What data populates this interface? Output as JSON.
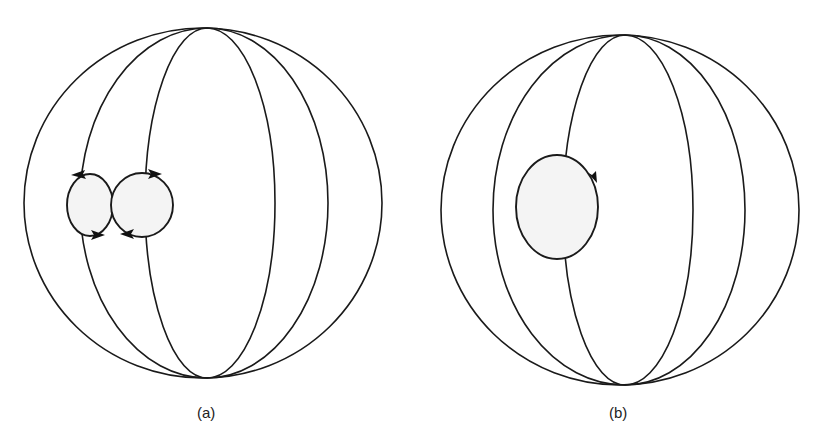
{
  "figure": {
    "panels": [
      {
        "id": "a",
        "caption": "(a)",
        "description": "Sphere with meridians; two adjacent circulation loops of opposite sense on the left side",
        "loops": [
          {
            "name": "left-loop",
            "direction": "counterclockwise"
          },
          {
            "name": "right-loop",
            "direction": "clockwise"
          }
        ]
      },
      {
        "id": "b",
        "caption": "(b)",
        "description": "Sphere with meridians; single circulation loop on the left side",
        "loops": [
          {
            "name": "single-loop",
            "direction": "clockwise"
          }
        ]
      }
    ],
    "colors": {
      "stroke": "#1a1a1a",
      "loop_fill": "#f4f4f4",
      "background": "#ffffff"
    }
  }
}
